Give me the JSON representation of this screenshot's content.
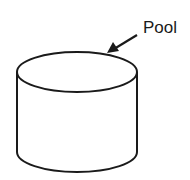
{
  "diagram": {
    "shape": "cylinder",
    "label": "Pool",
    "stroke_color": "#1a1a1a",
    "fill_color": "#ffffff"
  }
}
